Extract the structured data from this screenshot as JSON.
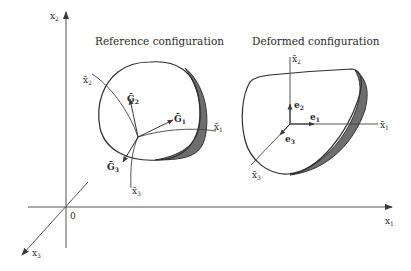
{
  "diagram": {
    "type": "continuum-mechanics-configuration",
    "colors": {
      "line": "#3a3a3a",
      "shell_shade": "#6e6e6e",
      "text": "#2a2a2a",
      "background": "#ffffff"
    },
    "global_axes": {
      "origin_label": "0",
      "x1": {
        "base": "x",
        "sub": "1"
      },
      "x2": {
        "base": "x",
        "sub": "2"
      },
      "x3": {
        "base": "x",
        "sub": "3"
      }
    },
    "reference": {
      "title": "Reference configuration",
      "curvilinear_axes": {
        "x1": {
          "base": "x̄",
          "sub": "1"
        },
        "x2": {
          "base": "x̄",
          "sub": "2"
        },
        "x3": {
          "base": "x̄",
          "sub": "3"
        }
      },
      "base_vectors": {
        "G1": {
          "base": "Ḡ",
          "sub": "1"
        },
        "G2": {
          "base": "Ḡ",
          "sub": "2"
        },
        "G3": {
          "base": "Ḡ",
          "sub": "3"
        }
      }
    },
    "deformed": {
      "title": "Deformed configuration",
      "curvilinear_axes": {
        "x1": {
          "base": "x̄",
          "sub": "1"
        },
        "x2": {
          "base": "x̄",
          "sub": "2"
        },
        "x3": {
          "base": "x̄",
          "sub": "3"
        }
      },
      "base_vectors": {
        "e1": {
          "base": "e",
          "sub": "1"
        },
        "e2": {
          "base": "e",
          "sub": "2"
        },
        "e3": {
          "base": "e",
          "sub": "3"
        }
      }
    }
  }
}
